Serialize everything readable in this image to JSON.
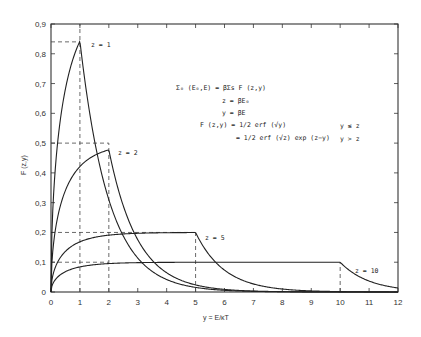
{
  "chart_data": {
    "type": "line",
    "title": "",
    "xlabel": "y = E/κT",
    "ylabel": "F (z,y)",
    "xlim": [
      0,
      12
    ],
    "ylim": [
      0,
      0.9
    ],
    "xticks": [
      "0",
      "1",
      "2",
      "3",
      "4",
      "5",
      "6",
      "7",
      "8",
      "9",
      "10",
      "11",
      "12"
    ],
    "yticks": [
      "0",
      "0.1",
      "0.2",
      "0.3",
      "0.4",
      "0.5",
      "0.6",
      "0.7",
      "0.8",
      "0.9"
    ],
    "grid": false,
    "legend": "inline curve labels",
    "series": [
      {
        "name": "z=1",
        "z": 1,
        "peak": {
          "x": 1,
          "y": 0.84
        }
      },
      {
        "name": "z=2",
        "z": 2,
        "peak": {
          "x": 2,
          "y": 0.47
        }
      },
      {
        "name": "z=5",
        "z": 5,
        "peak": {
          "x": 5,
          "y": 0.19
        }
      },
      {
        "name": "z=10",
        "z": 10,
        "peak": {
          "x": 10,
          "y": 0.09
        }
      }
    ],
    "dashed_guides": [
      {
        "x": 1,
        "y": 0.84
      },
      {
        "x": 2,
        "y": 0.5
      },
      {
        "x": 5,
        "y": 0.2
      },
      {
        "x": 10,
        "y": 0.1
      }
    ],
    "annotations": [
      "Σ₀ (E₀,E) = βΣs F (z,y)",
      "z = βE₀",
      "y = βE",
      "F (z,y) = 1/2 erf (√y)",
      "= 1/2 erf (√z) exp (z−y)",
      "y ≤ z",
      "y > z"
    ]
  },
  "labels": {
    "curve_z1": "z = 1",
    "curve_z2": "z = 2",
    "curve_z5": "z = 5",
    "curve_z10": "z = 10",
    "eq1": "Σ₀ (E₀,E) = βΣs F (z,y)",
    "eq2": "z = βE₀",
    "eq3": "y = βE",
    "eq4": "F (z,y) = 1/2 erf (√y)",
    "eq5": "= 1/2 erf (√z) exp (z−y)",
    "cond1": "y ≤ z",
    "cond2": "y > z",
    "xlabel": "y = E/κT",
    "ylabel": "F (z,y)"
  }
}
